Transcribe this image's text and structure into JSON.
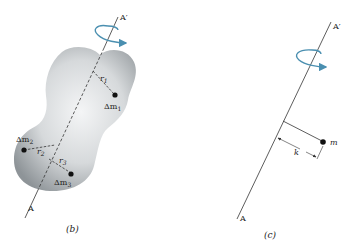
{
  "figure_b": {
    "caption": "(b)",
    "axis_bottom_label": "A",
    "axis_top_label": "A′",
    "masses": [
      {
        "label_prefix": "Δm",
        "label_sub": "1",
        "radius_label": "r",
        "radius_sub": "1"
      },
      {
        "label_prefix": "Δm",
        "label_sub": "2",
        "radius_label": "r",
        "radius_sub": "2"
      },
      {
        "label_prefix": "Δm",
        "label_sub": "3",
        "radius_label": "r",
        "radius_sub": "3"
      }
    ]
  },
  "figure_c": {
    "caption": "(c)",
    "axis_bottom_label": "A",
    "axis_top_label": "A′",
    "mass_label": "m",
    "gyration_label": "k"
  },
  "colors": {
    "rotation_arrow": "#4a8fb0",
    "body_fill_light": "#f2f3f4",
    "body_fill_dark": "#9fa4a8",
    "line": "#333333"
  }
}
